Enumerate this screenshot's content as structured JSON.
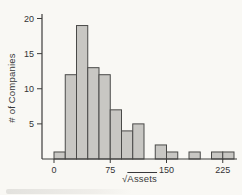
{
  "figure": {
    "background": "#f9f8f4"
  },
  "chart_data": {
    "type": "bar",
    "subtype": "histogram",
    "title": "",
    "xlabel": "√Assets",
    "xlabel_radical": "√",
    "xlabel_radicand": "Assets",
    "ylabel": "# of Companies",
    "bin_width": 15,
    "bin_edges": [
      0,
      15,
      30,
      45,
      60,
      75,
      90,
      105,
      120,
      135,
      150,
      165,
      180,
      195,
      210,
      225,
      240
    ],
    "counts": [
      1,
      12,
      19,
      13,
      12,
      7,
      4,
      5,
      0,
      2,
      1,
      0,
      1,
      0,
      1,
      1
    ],
    "x_ticks": [
      0,
      75,
      150,
      225
    ],
    "y_ticks": [
      5,
      10,
      15,
      20
    ],
    "xlim": [
      -16,
      244
    ],
    "ylim": [
      0,
      20.5
    ],
    "grid": false,
    "legend": null,
    "colors": {
      "bar_fill": "#c8c7c3",
      "bar_stroke": "#4a4a48",
      "axis": "#3d3d3b",
      "text": "#333335"
    }
  }
}
